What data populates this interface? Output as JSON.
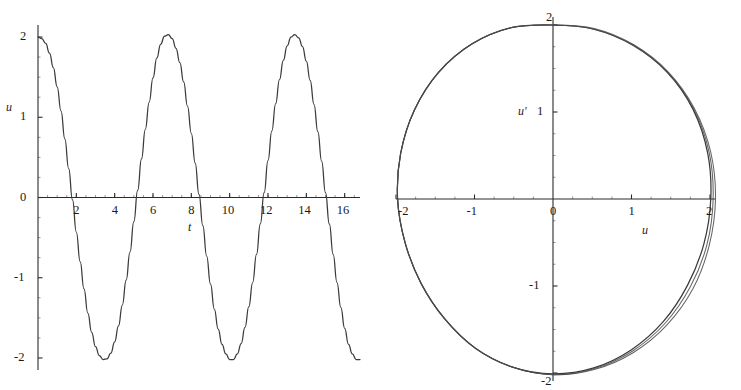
{
  "figure": {
    "background": "#ffffff",
    "curve_color": "#3a3a3a",
    "axis_color": "#2b2b2b"
  },
  "chart_data": [
    {
      "type": "line",
      "id": "time-series",
      "title": "",
      "xlabel": "t",
      "ylabel": "u",
      "xlim": [
        0,
        16.8
      ],
      "ylim": [
        -2.15,
        2.15
      ],
      "grid": false,
      "legend": "none",
      "xticks": [
        2,
        4,
        6,
        8,
        10,
        12,
        14,
        16
      ],
      "xticklabels": [
        "2",
        "4",
        "6",
        "8",
        "10",
        "12",
        "14",
        "16"
      ],
      "yticks": [
        2,
        1,
        0,
        -1,
        -2
      ],
      "yticklabels": [
        "2",
        "1",
        "0",
        "-1",
        "-2"
      ],
      "description": "Nonlinear oscillator displacement u versus time t; amplitude 2, period about 6.6, slightly non-sinusoidal waveform with flattened crests and broadened troughs.",
      "series": [
        {
          "name": "u(t)",
          "x": [
            0.0,
            0.2,
            0.4,
            0.6,
            0.8,
            1.0,
            1.2,
            1.4,
            1.6,
            1.8,
            2.0,
            2.2,
            2.4,
            2.6,
            2.8,
            3.0,
            3.2,
            3.4,
            3.6,
            3.8,
            4.0,
            4.2,
            4.4,
            4.6,
            4.8,
            5.0,
            5.2,
            5.4,
            5.6,
            5.8,
            6.0,
            6.2,
            6.4,
            6.6,
            6.8,
            7.0,
            7.2,
            7.4,
            7.6,
            7.8,
            8.0,
            8.2,
            8.4,
            8.6,
            8.8,
            9.0,
            9.2,
            9.4,
            9.6,
            9.8,
            10.0,
            10.2,
            10.4,
            10.6,
            10.8,
            11.0,
            11.2,
            11.4,
            11.6,
            11.8,
            12.0,
            12.2,
            12.4,
            12.6,
            12.8,
            13.0,
            13.2,
            13.4,
            13.6,
            13.8,
            14.0,
            14.2,
            14.4,
            14.6,
            14.8,
            15.0,
            15.2,
            15.4,
            15.6,
            15.8,
            16.0,
            16.2,
            16.4,
            16.6,
            16.8
          ],
          "y": [
            2.0,
            1.98,
            1.92,
            1.8,
            1.62,
            1.38,
            1.08,
            0.73,
            0.36,
            -0.03,
            -0.43,
            -0.8,
            -1.14,
            -1.44,
            -1.68,
            -1.86,
            -1.97,
            -2.02,
            -2.01,
            -1.94,
            -1.8,
            -1.6,
            -1.34,
            -1.03,
            -0.68,
            -0.3,
            0.09,
            0.48,
            0.85,
            1.19,
            1.49,
            1.74,
            1.91,
            2.01,
            2.03,
            1.98,
            1.86,
            1.68,
            1.44,
            1.14,
            0.8,
            0.43,
            0.04,
            -0.35,
            -0.73,
            -1.08,
            -1.39,
            -1.64,
            -1.83,
            -1.95,
            -2.02,
            -2.02,
            -1.95,
            -1.82,
            -1.62,
            -1.36,
            -1.06,
            -0.71,
            -0.33,
            0.06,
            0.46,
            0.83,
            1.17,
            1.47,
            1.71,
            1.89,
            2.0,
            2.03,
            1.99,
            1.88,
            1.7,
            1.46,
            1.16,
            0.82,
            0.45,
            0.06,
            -0.33,
            -0.71,
            -1.06,
            -1.37,
            -1.63,
            -1.83,
            -1.95,
            -2.02,
            -2.02
          ]
        }
      ]
    },
    {
      "type": "line",
      "id": "phase-portrait",
      "title": "",
      "xlabel": "u",
      "ylabel": "u'",
      "xlim": [
        -2.2,
        2.2
      ],
      "ylim": [
        -2.2,
        2.2
      ],
      "grid": false,
      "legend": "none",
      "xticks": [
        -2,
        -1,
        0,
        1,
        2
      ],
      "xticklabels": [
        "-2",
        "-1",
        "0",
        "1",
        "2"
      ],
      "yticks": [
        2,
        1,
        -1,
        -2
      ],
      "yticklabels": [
        "2",
        "1",
        "-1",
        "-2"
      ],
      "description": "Phase plane trajectory u' versus u forming a closed, slightly distorted circular orbit of radius about 2; successive cycles nearly overlap, with a visible sliver of separation in the lower-right quadrant indicating slow drift.",
      "series": [
        {
          "name": "orbit-cycle-1",
          "theta_deg": [
            90,
            75,
            60,
            45,
            30,
            15,
            0,
            -15,
            -30,
            -45,
            -60,
            -75,
            -90,
            -105,
            -120,
            -135,
            -150,
            -165,
            180,
            165,
            150,
            135,
            120,
            105,
            90
          ],
          "radius": [
            2.0,
            2.02,
            2.04,
            2.06,
            2.06,
            2.04,
            2.01,
            1.99,
            1.98,
            1.99,
            2.0,
            2.01,
            2.01,
            2.0,
            1.98,
            1.95,
            1.94,
            1.95,
            1.98,
            2.01,
            2.04,
            2.06,
            2.06,
            2.04,
            2.0
          ]
        },
        {
          "name": "orbit-cycle-2",
          "theta_deg": [
            90,
            75,
            60,
            45,
            30,
            15,
            0,
            -15,
            -30,
            -45,
            -60,
            -75,
            -90,
            -105,
            -120,
            -135,
            -150,
            -165,
            180,
            165,
            150,
            135,
            120,
            105,
            90
          ],
          "radius": [
            2.0,
            2.02,
            2.04,
            2.06,
            2.07,
            2.06,
            2.04,
            2.03,
            2.02,
            2.02,
            2.02,
            2.02,
            2.02,
            2.0,
            1.98,
            1.95,
            1.94,
            1.95,
            1.98,
            2.01,
            2.04,
            2.06,
            2.06,
            2.04,
            2.0
          ]
        },
        {
          "name": "orbit-cycle-3",
          "theta_deg": [
            90,
            75,
            60,
            45,
            30,
            15,
            0,
            -15,
            -30,
            -45,
            -60,
            -75,
            -90,
            -105,
            -120,
            -135,
            -150,
            -165,
            180,
            165,
            150,
            135,
            120,
            105,
            90
          ],
          "radius": [
            2.0,
            2.03,
            2.05,
            2.07,
            2.08,
            2.08,
            2.07,
            2.06,
            2.06,
            2.05,
            2.04,
            2.03,
            2.02,
            2.0,
            1.98,
            1.95,
            1.94,
            1.95,
            1.98,
            2.01,
            2.04,
            2.06,
            2.06,
            2.04,
            2.0
          ]
        }
      ]
    }
  ],
  "time_panel": {
    "y_axis_label": "u",
    "x_axis_label": "t",
    "y_tick_labels": [
      {
        "text": "2",
        "value": 2
      },
      {
        "text": "1",
        "value": 1
      },
      {
        "text": "0",
        "value": 0
      },
      {
        "text": "-1",
        "value": -1
      },
      {
        "text": "-2",
        "value": -2
      }
    ],
    "x_tick_labels": [
      {
        "text": "2",
        "value": 2
      },
      {
        "text": "4",
        "value": 4
      },
      {
        "text": "6",
        "value": 6
      },
      {
        "text": "8",
        "value": 8
      },
      {
        "text": "10",
        "value": 10
      },
      {
        "text": "12",
        "value": 12
      },
      {
        "text": "14",
        "value": 14
      },
      {
        "text": "16",
        "value": 16
      }
    ]
  },
  "phase_panel": {
    "y_axis_label": "u'",
    "x_axis_label": "u",
    "y_tick_labels": [
      {
        "text": "2",
        "value": 2
      },
      {
        "text": "1",
        "value": 1
      },
      {
        "text": "-1",
        "value": -1
      },
      {
        "text": "-2",
        "value": -2
      }
    ],
    "x_tick_labels": [
      {
        "text": "-2",
        "value": -2
      },
      {
        "text": "-1",
        "value": -1
      },
      {
        "text": "0",
        "value": 0
      },
      {
        "text": "1",
        "value": 1
      },
      {
        "text": "2",
        "value": 2
      }
    ]
  }
}
